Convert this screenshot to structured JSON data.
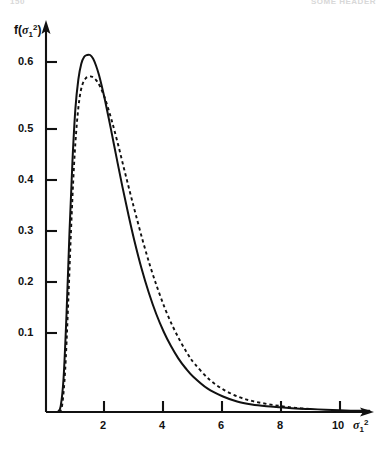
{
  "page": {
    "header_left": "150",
    "header_right": "SOME HEADER"
  },
  "axes": {
    "y_label": "f(σ₁²)",
    "x_label": "σ₁²",
    "y_ticks": [
      "0.1",
      "0.2",
      "0.3",
      "0.4",
      "0.5",
      "0.6"
    ],
    "x_ticks": [
      "2",
      "4",
      "6",
      "8",
      "10"
    ]
  },
  "chart_data": {
    "type": "line",
    "title": "",
    "subtitle": "",
    "xlabel": "σ₁²",
    "ylabel": "f(σ₁²)",
    "xlim": [
      0,
      11.2
    ],
    "ylim": [
      0,
      0.66
    ],
    "xticks": [
      2,
      4,
      6,
      8,
      10
    ],
    "yticks": [
      0.1,
      0.2,
      0.3,
      0.4,
      0.5,
      0.6
    ],
    "grid": false,
    "legend": "none",
    "annotations": [],
    "series": [
      {
        "name": "solid-curve",
        "style": "solid",
        "color": "#111111",
        "peak_x": 1.5,
        "peak_y": 0.612,
        "x": [
          0.4,
          0.5,
          0.6,
          0.7,
          0.8,
          0.9,
          1.0,
          1.1,
          1.2,
          1.3,
          1.4,
          1.5,
          1.6,
          1.7,
          1.8,
          1.9,
          2.0,
          2.2,
          2.4,
          2.6,
          2.8,
          3.0,
          3.25,
          3.5,
          3.75,
          4.0,
          4.25,
          4.5,
          4.75,
          5.0,
          5.5,
          6.0,
          6.5,
          7.0,
          7.5,
          8.0,
          8.5,
          9.0,
          9.5,
          10.0,
          10.5,
          11.0
        ],
        "y": [
          0.0,
          0.01,
          0.06,
          0.17,
          0.31,
          0.43,
          0.52,
          0.57,
          0.597,
          0.609,
          0.612,
          0.612,
          0.606,
          0.594,
          0.578,
          0.558,
          0.536,
          0.487,
          0.436,
          0.386,
          0.339,
          0.295,
          0.246,
          0.204,
          0.168,
          0.138,
          0.113,
          0.092,
          0.075,
          0.061,
          0.04,
          0.027,
          0.018,
          0.013,
          0.01,
          0.008,
          0.006,
          0.005,
          0.004,
          0.003,
          0.002,
          0.002
        ]
      },
      {
        "name": "dashed-curve",
        "style": "dashed",
        "color": "#111111",
        "peak_x": 1.6,
        "peak_y": 0.575,
        "x": [
          0.45,
          0.55,
          0.65,
          0.75,
          0.85,
          0.95,
          1.05,
          1.15,
          1.25,
          1.35,
          1.45,
          1.55,
          1.65,
          1.75,
          1.85,
          1.95,
          2.05,
          2.25,
          2.45,
          2.65,
          2.85,
          3.05,
          3.3,
          3.55,
          3.8,
          4.05,
          4.3,
          4.55,
          4.8,
          5.05,
          5.55,
          6.05,
          6.55,
          7.0,
          7.5,
          8.0,
          8.5,
          9.0
        ],
        "y": [
          0.0,
          0.012,
          0.07,
          0.18,
          0.31,
          0.42,
          0.495,
          0.541,
          0.563,
          0.572,
          0.575,
          0.575,
          0.572,
          0.566,
          0.557,
          0.545,
          0.531,
          0.497,
          0.459,
          0.418,
          0.378,
          0.339,
          0.292,
          0.249,
          0.211,
          0.177,
          0.148,
          0.123,
          0.101,
          0.083,
          0.056,
          0.038,
          0.026,
          0.019,
          0.014,
          0.01,
          0.007,
          0.005
        ]
      }
    ]
  }
}
